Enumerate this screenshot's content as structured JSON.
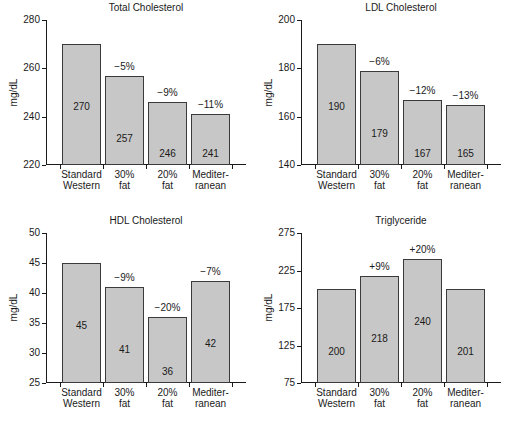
{
  "figure": {
    "width": 509,
    "height": 429,
    "background": "#ffffff",
    "bar_fill": "#c7c7c7",
    "bar_edge": "#3a3a3a",
    "axis_color": "#1a1a1a"
  },
  "chart_data": [
    {
      "type": "bar",
      "title": "Total Cholesterol",
      "xlabel": "",
      "ylabel": "mg/dL",
      "categories": [
        "Standard Western",
        "30% fat",
        "20% fat",
        "Mediterranean"
      ],
      "category_lines": [
        [
          "Standard",
          "Western"
        ],
        [
          "30%",
          "fat"
        ],
        [
          "20%",
          "fat"
        ],
        [
          "Mediter-",
          "ranean"
        ]
      ],
      "values": [
        270,
        257,
        246,
        241
      ],
      "value_labels": [
        "270",
        "257",
        "246",
        "241"
      ],
      "delta_labels": [
        "",
        "−5%",
        "−9%",
        "−11%"
      ],
      "ylim": [
        220,
        280
      ],
      "yticks": [
        220,
        240,
        260,
        280
      ],
      "ytick_labels": [
        "220",
        "240",
        "260",
        "280"
      ],
      "grid": false,
      "legend": "none"
    },
    {
      "type": "bar",
      "title": "LDL Cholesterol",
      "xlabel": "",
      "ylabel": "mg/dL",
      "categories": [
        "Standard Western",
        "30% fat",
        "20% fat",
        "Mediterranean"
      ],
      "category_lines": [
        [
          "Standard",
          "Western"
        ],
        [
          "30%",
          "fat"
        ],
        [
          "20%",
          "fat"
        ],
        [
          "Mediter-",
          "ranean"
        ]
      ],
      "values": [
        190,
        179,
        167,
        165
      ],
      "value_labels": [
        "190",
        "179",
        "167",
        "165"
      ],
      "delta_labels": [
        "",
        "−6%",
        "−12%",
        "−13%"
      ],
      "ylim": [
        140,
        200
      ],
      "yticks": [
        140,
        160,
        180,
        200
      ],
      "ytick_labels": [
        "140",
        "160",
        "180",
        "200"
      ],
      "grid": false,
      "legend": "none"
    },
    {
      "type": "bar",
      "title": "HDL Cholesterol",
      "xlabel": "Diet type",
      "ylabel": "mg/dL",
      "categories": [
        "Standard Western",
        "30% fat",
        "20% fat",
        "Mediterranean"
      ],
      "category_lines": [
        [
          "Standard",
          "Western"
        ],
        [
          "30%",
          "fat"
        ],
        [
          "20%",
          "fat"
        ],
        [
          "Mediter-",
          "ranean"
        ]
      ],
      "values": [
        45,
        41,
        36,
        42
      ],
      "value_labels": [
        "45",
        "41",
        "36",
        "42"
      ],
      "delta_labels": [
        "",
        "−9%",
        "−20%",
        "−7%"
      ],
      "ylim": [
        25,
        50
      ],
      "yticks": [
        25,
        30,
        35,
        40,
        45,
        50
      ],
      "ytick_labels": [
        "25",
        "30",
        "35",
        "40",
        "45",
        "50"
      ],
      "grid": false,
      "legend": "none"
    },
    {
      "type": "bar",
      "title": "Triglyceride",
      "xlabel": "Diet type",
      "ylabel": "mg/dL",
      "categories": [
        "Standard Western",
        "30% fat",
        "20% fat",
        "Mediterranean"
      ],
      "category_lines": [
        [
          "Standard",
          "Western"
        ],
        [
          "30%",
          "fat"
        ],
        [
          "20%",
          "fat"
        ],
        [
          "Mediter-",
          "ranean"
        ]
      ],
      "values": [
        200,
        218,
        240,
        201
      ],
      "value_labels": [
        "200",
        "218",
        "240",
        "201"
      ],
      "delta_labels": [
        "",
        "+9%",
        "+20%",
        ""
      ],
      "ylim": [
        75,
        275
      ],
      "yticks": [
        75,
        125,
        175,
        225,
        275
      ],
      "ytick_labels": [
        "75",
        "125",
        "175",
        "225",
        "275"
      ],
      "grid": false,
      "legend": "none"
    }
  ]
}
